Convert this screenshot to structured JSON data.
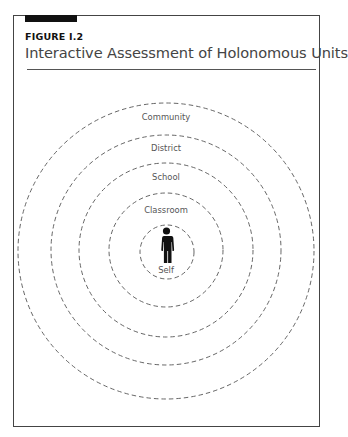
{
  "figure": {
    "label": "FIGURE I.2",
    "title": "Interactive Assessment of Holonomous Units"
  },
  "diagram": {
    "type": "concentric-circles",
    "center_icon": "person-icon",
    "rings": [
      {
        "label": "Self",
        "radius": 27
      },
      {
        "label": "Classroom",
        "radius": 57
      },
      {
        "label": "School",
        "radius": 87
      },
      {
        "label": "District",
        "radius": 115
      },
      {
        "label": "Community",
        "radius": 148
      }
    ]
  },
  "colors": {
    "border": "#444444",
    "ring_stroke": "#555555",
    "text": "#444444",
    "icon": "#111111"
  }
}
